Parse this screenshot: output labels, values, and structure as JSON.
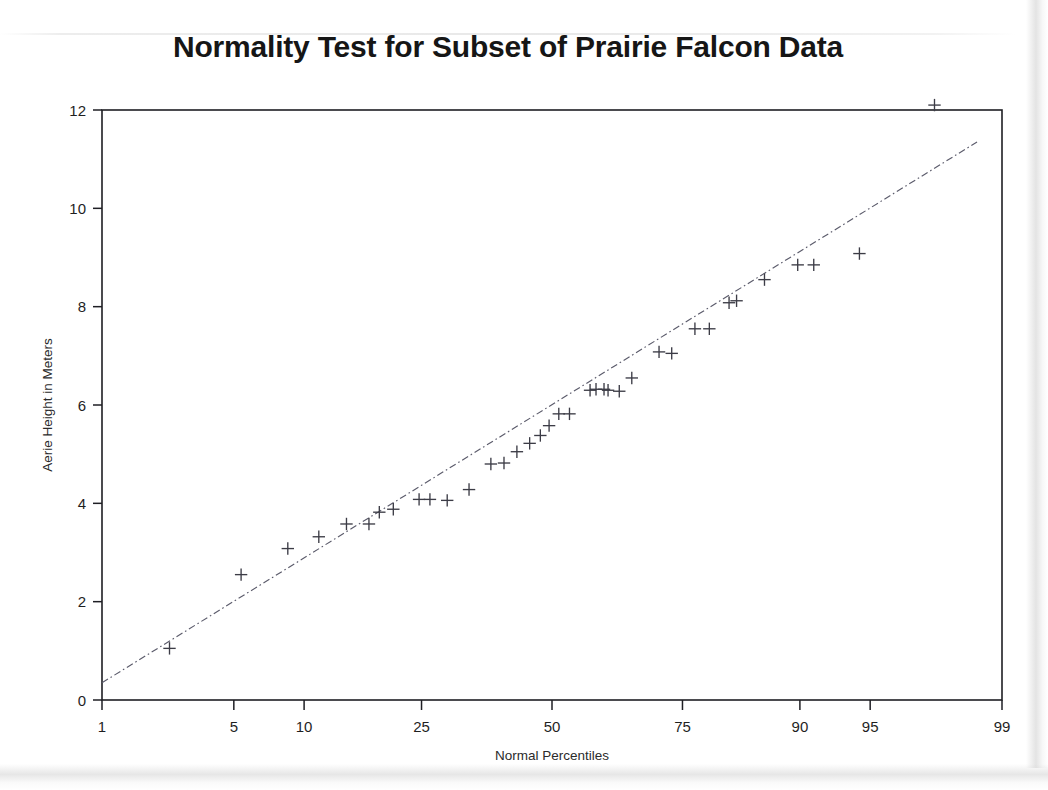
{
  "chart_data": {
    "type": "scatter",
    "title": "Normality Test for Subset of Prairie Falcon Data",
    "xlabel": "Normal Percentiles",
    "ylabel": "Aerie Height in Meters",
    "xscale": "normal-probability",
    "yscale": "linear",
    "grid": false,
    "legend": "none",
    "xticks": [
      1,
      5,
      10,
      25,
      50,
      75,
      90,
      95,
      99
    ],
    "xtick_labels": [
      "1",
      "5",
      "10",
      "25",
      "50",
      "75",
      "90",
      "95",
      "99"
    ],
    "xlim": [
      1,
      99
    ],
    "yticks": [
      0,
      2,
      4,
      6,
      8,
      10,
      12
    ],
    "ytick_labels": [
      "0",
      "2",
      "4",
      "6",
      "8",
      "10",
      "12"
    ],
    "ylim": [
      0,
      12.4
    ],
    "marker": "plus",
    "marker_color": "#3c3c46",
    "reference_line": {
      "style": "dash-dot",
      "color": "#5b5b6b",
      "x_start_percentile": 1,
      "y_start": 0.35,
      "x_end_percentile": 98.6,
      "y_end": 11.35
    },
    "series": [
      {
        "name": "Aerie Height",
        "points": [
          {
            "percentile": 2.4,
            "height": 1.05
          },
          {
            "percentile": 5.4,
            "height": 2.55
          },
          {
            "percentile": 8.6,
            "height": 3.08
          },
          {
            "percentile": 11.4,
            "height": 3.32
          },
          {
            "percentile": 14.4,
            "height": 3.58
          },
          {
            "percentile": 17.2,
            "height": 3.58
          },
          {
            "percentile": 18.6,
            "height": 3.82
          },
          {
            "percentile": 20.6,
            "height": 3.88
          },
          {
            "percentile": 24.6,
            "height": 4.08
          },
          {
            "percentile": 26.4,
            "height": 4.08
          },
          {
            "percentile": 29.4,
            "height": 4.06
          },
          {
            "percentile": 33.4,
            "height": 4.28
          },
          {
            "percentile": 37.6,
            "height": 4.8
          },
          {
            "percentile": 40.2,
            "height": 4.82
          },
          {
            "percentile": 42.8,
            "height": 5.05
          },
          {
            "percentile": 45.4,
            "height": 5.22
          },
          {
            "percentile": 47.6,
            "height": 5.38
          },
          {
            "percentile": 49.4,
            "height": 5.58
          },
          {
            "percentile": 51.4,
            "height": 5.82
          },
          {
            "percentile": 53.6,
            "height": 5.82
          },
          {
            "percentile": 57.8,
            "height": 6.3
          },
          {
            "percentile": 59.0,
            "height": 6.32
          },
          {
            "percentile": 60.6,
            "height": 6.32
          },
          {
            "percentile": 61.4,
            "height": 6.3
          },
          {
            "percentile": 63.6,
            "height": 6.28
          },
          {
            "percentile": 66.0,
            "height": 6.55
          },
          {
            "percentile": 71.0,
            "height": 7.08
          },
          {
            "percentile": 73.2,
            "height": 7.05
          },
          {
            "percentile": 77.0,
            "height": 7.55
          },
          {
            "percentile": 79.2,
            "height": 7.55
          },
          {
            "percentile": 82.0,
            "height": 8.08
          },
          {
            "percentile": 83.0,
            "height": 8.12
          },
          {
            "percentile": 86.4,
            "height": 8.55
          },
          {
            "percentile": 89.8,
            "height": 8.85
          },
          {
            "percentile": 91.2,
            "height": 8.85
          },
          {
            "percentile": 94.4,
            "height": 9.08
          },
          {
            "percentile": 97.6,
            "height": 12.1
          }
        ]
      }
    ]
  },
  "axis": {
    "y_title": "Aerie Height in Meters",
    "x_title": "Normal Percentiles"
  }
}
